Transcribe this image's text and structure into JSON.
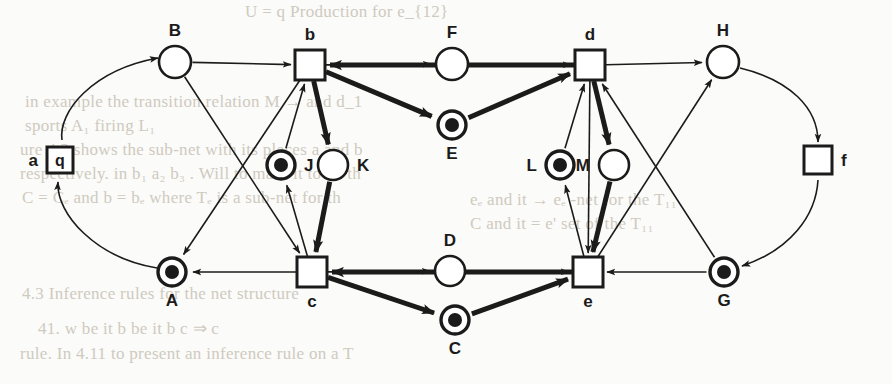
{
  "figure": {
    "kind": "petri-net-diagram",
    "stroke_color": "#1b1b1b",
    "fill_color": "#ffffff",
    "token_color": "#1b1b1b",
    "background_color": "#fbfbf9",
    "scan_text_color": "#cfcabf",
    "thin_width": 1.6,
    "thick_width": 5.0,
    "width": 892,
    "height": 384
  },
  "places": [
    {
      "id": "B",
      "label": "B",
      "x": 175,
      "y": 62,
      "r": 16,
      "marked": false,
      "label_pos": "above"
    },
    {
      "id": "F",
      "label": "F",
      "x": 452,
      "y": 64,
      "r": 16,
      "marked": false,
      "label_pos": "above"
    },
    {
      "id": "H",
      "label": "H",
      "x": 723,
      "y": 62,
      "r": 16,
      "marked": false,
      "label_pos": "above"
    },
    {
      "id": "E",
      "label": "E",
      "x": 452,
      "y": 125,
      "r": 14,
      "marked": true,
      "label_pos": "below"
    },
    {
      "id": "J",
      "label": "J",
      "x": 281,
      "y": 165,
      "r": 14,
      "marked": true,
      "label_pos": "right"
    },
    {
      "id": "K",
      "label": "K",
      "x": 333,
      "y": 165,
      "r": 15,
      "marked": false,
      "label_pos": "right"
    },
    {
      "id": "L",
      "label": "L",
      "x": 560,
      "y": 165,
      "r": 14,
      "marked": true,
      "label_pos": "left"
    },
    {
      "id": "M",
      "label": "M",
      "x": 614,
      "y": 165,
      "r": 15,
      "marked": false,
      "label_pos": "left"
    },
    {
      "id": "A",
      "label": "A",
      "x": 172,
      "y": 272,
      "r": 14,
      "marked": true,
      "label_pos": "below"
    },
    {
      "id": "D",
      "label": "D",
      "x": 450,
      "y": 271,
      "r": 15,
      "marked": false,
      "label_pos": "above"
    },
    {
      "id": "G",
      "label": "G",
      "x": 724,
      "y": 272,
      "r": 14,
      "marked": true,
      "label_pos": "below"
    },
    {
      "id": "C",
      "label": "C",
      "x": 455,
      "y": 320,
      "r": 14,
      "marked": true,
      "label_pos": "below"
    }
  ],
  "transitions": [
    {
      "id": "q",
      "label": "q",
      "inner_text": "q",
      "x": 60,
      "y": 160,
      "size": 26,
      "label_pos": "left"
    },
    {
      "id": "b",
      "label": "b",
      "inner_text": "",
      "x": 310,
      "y": 65,
      "size": 30,
      "label_pos": "above"
    },
    {
      "id": "d",
      "label": "d",
      "inner_text": "",
      "x": 590,
      "y": 65,
      "size": 30,
      "label_pos": "above"
    },
    {
      "id": "f",
      "label": "f",
      "inner_text": "",
      "x": 818,
      "y": 160,
      "size": 28,
      "label_pos": "right"
    },
    {
      "id": "c",
      "label": "c",
      "inner_text": "",
      "x": 312,
      "y": 272,
      "size": 30,
      "label_pos": "below"
    },
    {
      "id": "e",
      "label": "e",
      "inner_text": "",
      "x": 588,
      "y": 272,
      "size": 30,
      "label_pos": "below"
    }
  ],
  "transition_labels": {
    "q_outer": "a",
    "f_outer": "f",
    "q_inner": "q"
  },
  "arcs": [
    {
      "from": "q",
      "to": "B",
      "weight": "thin",
      "shape": "curve",
      "note": "a/q up to B"
    },
    {
      "from": "B",
      "to": "b",
      "weight": "thin",
      "shape": "line"
    },
    {
      "from": "B",
      "to": "c",
      "weight": "thin",
      "shape": "line"
    },
    {
      "from": "b",
      "to": "A",
      "weight": "thin",
      "shape": "line"
    },
    {
      "from": "A",
      "to": "q",
      "weight": "thin",
      "shape": "curve"
    },
    {
      "from": "b",
      "to": "F",
      "weight": "thin",
      "shape": "line"
    },
    {
      "from": "F",
      "to": "d",
      "weight": "thin",
      "shape": "line"
    },
    {
      "from": "b",
      "to": "E",
      "weight": "thick",
      "shape": "line"
    },
    {
      "from": "E",
      "to": "d",
      "weight": "thick",
      "shape": "line"
    },
    {
      "from": "d",
      "to": "b",
      "weight": "thick",
      "shape": "line",
      "note": "E chain back"
    },
    {
      "from": "d",
      "to": "H",
      "weight": "thin",
      "shape": "line"
    },
    {
      "from": "H",
      "to": "f",
      "weight": "thin",
      "shape": "curve"
    },
    {
      "from": "f",
      "to": "G",
      "weight": "thin",
      "shape": "curve"
    },
    {
      "from": "G",
      "to": "e",
      "weight": "thin",
      "shape": "line"
    },
    {
      "from": "G",
      "to": "d",
      "weight": "thin",
      "shape": "line"
    },
    {
      "from": "c",
      "to": "A",
      "weight": "thin",
      "shape": "line"
    },
    {
      "from": "c",
      "to": "J",
      "weight": "thin",
      "shape": "line"
    },
    {
      "from": "J",
      "to": "b",
      "weight": "thin",
      "shape": "line"
    },
    {
      "from": "b",
      "to": "K",
      "weight": "thick",
      "shape": "line"
    },
    {
      "from": "K",
      "to": "c",
      "weight": "thick",
      "shape": "line"
    },
    {
      "from": "c",
      "to": "D",
      "weight": "thin",
      "shape": "line"
    },
    {
      "from": "D",
      "to": "e",
      "weight": "thin",
      "shape": "line"
    },
    {
      "from": "c",
      "to": "C",
      "weight": "thick",
      "shape": "line"
    },
    {
      "from": "C",
      "to": "e",
      "weight": "thick",
      "shape": "line"
    },
    {
      "from": "e",
      "to": "c",
      "weight": "thick",
      "shape": "line"
    },
    {
      "from": "e",
      "to": "L",
      "weight": "thin",
      "shape": "line"
    },
    {
      "from": "L",
      "to": "d",
      "weight": "thin",
      "shape": "line"
    },
    {
      "from": "d",
      "to": "M",
      "weight": "thick",
      "shape": "line"
    },
    {
      "from": "M",
      "to": "e",
      "weight": "thick",
      "shape": "line"
    },
    {
      "from": "e",
      "to": "H",
      "weight": "thin",
      "shape": "line"
    },
    {
      "from": "d",
      "to": "e",
      "weight": "thin",
      "shape": "line"
    }
  ],
  "background_text": [
    {
      "text": "U = q  Production for e_{12}",
      "x": 245,
      "y": 2,
      "size": 17
    },
    {
      "text": "in example the transition relation M  → and d_1",
      "x": 25,
      "y": 92,
      "size": 17
    },
    {
      "text": "sports  A₁  firing  L₁",
      "x": 25,
      "y": 116,
      "size": 17
    },
    {
      "text": "ure 4.2  shows the  sub-net with  its  places  a  and  b",
      "x": 20,
      "y": 140,
      "size": 17
    },
    {
      "text": "respectively. in  b₁ a₂  b₃ . Will  to  mark  it  to  be  th",
      "x": 20,
      "y": 164,
      "size": 17
    },
    {
      "text": "C = Cₑ and  b = bₑ where  Tₑ is  a  sub-net  for  th",
      "x": 22,
      "y": 188,
      "size": 17
    },
    {
      "text": "4.3  Inference rules for  the  net  structure",
      "x": 22,
      "y": 284,
      "size": 17
    },
    {
      "text": "41. w  be  it  b  be  it  b  c  ⇒  c",
      "x": 38,
      "y": 318,
      "size": 17
    },
    {
      "text": "rule.  In  4.11  to  present  an  inference  rule  on  a  T",
      "x": 20,
      "y": 344,
      "size": 17
    },
    {
      "text": "eₑ  and  it  →  eₑ -net  for  the  T₁₁",
      "x": 470,
      "y": 190,
      "size": 17
    },
    {
      "text": "C  and  it  =  e'  set  of  the  T₁₁",
      "x": 470,
      "y": 214,
      "size": 17
    }
  ]
}
